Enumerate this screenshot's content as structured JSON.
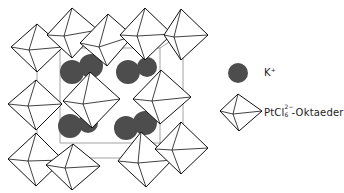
{
  "diagram": {
    "title": "",
    "colors": {
      "k_ion": "#4d4d4d",
      "octahedron_stroke": "#111111",
      "cell_edge": "#8a8a8a",
      "background": "#ffffff"
    }
  },
  "legend": {
    "items": [
      {
        "symbol": "filled-circle",
        "label": "K",
        "superscript": "+"
      },
      {
        "symbol": "octahedron",
        "label": "PtCl",
        "subscript": "6",
        "superscript": "2−",
        "suffix": "-Oktaeder"
      }
    ]
  }
}
